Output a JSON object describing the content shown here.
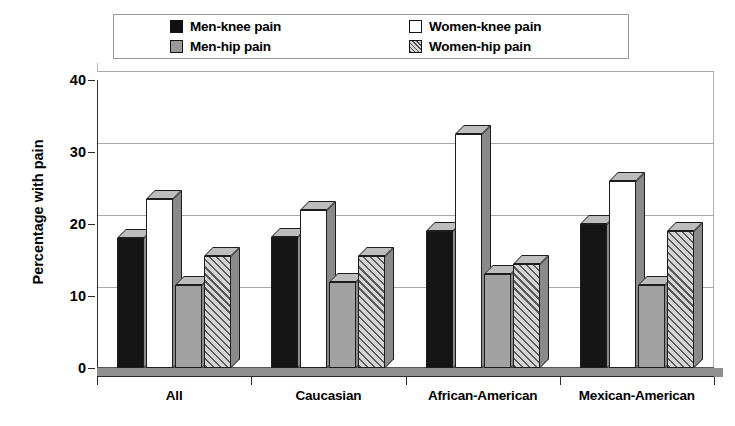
{
  "chart_data": {
    "type": "bar",
    "title": "",
    "subtitle": "",
    "xlabel": "",
    "ylabel": "Percentage with pain",
    "ylim": [
      0,
      40
    ],
    "yticks": [
      "0",
      "10",
      "20",
      "30",
      "40"
    ],
    "grid": true,
    "legend_position": "top",
    "categories": [
      "All",
      "Caucasian",
      "African-American",
      "Mexican-American"
    ],
    "series": [
      {
        "name": "Men-knee pain",
        "style": "black",
        "values": [
          18.0,
          18.2,
          19.0,
          20.0
        ]
      },
      {
        "name": "Women-knee pain",
        "style": "white",
        "values": [
          23.5,
          22.0,
          32.5,
          26.0
        ]
      },
      {
        "name": "Men-hip pain",
        "style": "gray",
        "values": [
          11.5,
          12.0,
          13.0,
          11.5
        ]
      },
      {
        "name": "Women-hip pain",
        "style": "hatch",
        "values": [
          15.5,
          15.5,
          14.5,
          19.0
        ]
      }
    ]
  },
  "legend": {
    "items": [
      {
        "label": "Men-knee pain",
        "swatch": "black-square-swatch"
      },
      {
        "label": "Women-knee pain",
        "swatch": "white-square-swatch"
      },
      {
        "label": "Men-hip pain",
        "swatch": "gray-square-swatch"
      },
      {
        "label": "Women-hip pain",
        "swatch": "hatched-square-swatch"
      }
    ]
  },
  "colors": {
    "men_knee": "#151515",
    "women_knee": "#ffffff",
    "men_hip": "#a2a2a2",
    "women_hip": "#808080",
    "gridline": "#a8a8a8",
    "axis": "#2b2b2b",
    "background": "#ffffff"
  }
}
